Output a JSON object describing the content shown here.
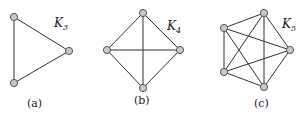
{
  "figure": {
    "graphs": [
      {
        "id": "a",
        "label_main": "K",
        "label_sub": "3",
        "caption": "(a)",
        "nodes": [
          [
            14,
            17
          ],
          [
            69,
            51
          ],
          [
            14,
            83
          ]
        ],
        "edges": [
          [
            0,
            1
          ],
          [
            1,
            2
          ],
          [
            0,
            2
          ]
        ]
      },
      {
        "id": "b",
        "label_main": "K",
        "label_sub": "4",
        "caption": "(b)",
        "nodes": [
          [
            143,
            13
          ],
          [
            107,
            50
          ],
          [
            180,
            50
          ],
          [
            143,
            88
          ]
        ],
        "edges": [
          [
            0,
            1
          ],
          [
            0,
            2
          ],
          [
            0,
            3
          ],
          [
            1,
            2
          ],
          [
            1,
            3
          ],
          [
            2,
            3
          ]
        ]
      },
      {
        "id": "c",
        "label_main": "K",
        "label_sub": "5",
        "caption": "(c)",
        "nodes": [
          [
            264,
            13
          ],
          [
            224,
            28
          ],
          [
            290,
            50
          ],
          [
            224,
            72
          ],
          [
            264,
            87
          ]
        ],
        "edges": [
          [
            0,
            1
          ],
          [
            0,
            2
          ],
          [
            0,
            3
          ],
          [
            0,
            4
          ],
          [
            1,
            2
          ],
          [
            1,
            3
          ],
          [
            1,
            4
          ],
          [
            2,
            3
          ],
          [
            2,
            4
          ],
          [
            3,
            4
          ]
        ]
      }
    ],
    "colors": {
      "node_fill": "#c8c8c8",
      "node_stroke": "#555555",
      "edge": "#333333"
    }
  }
}
